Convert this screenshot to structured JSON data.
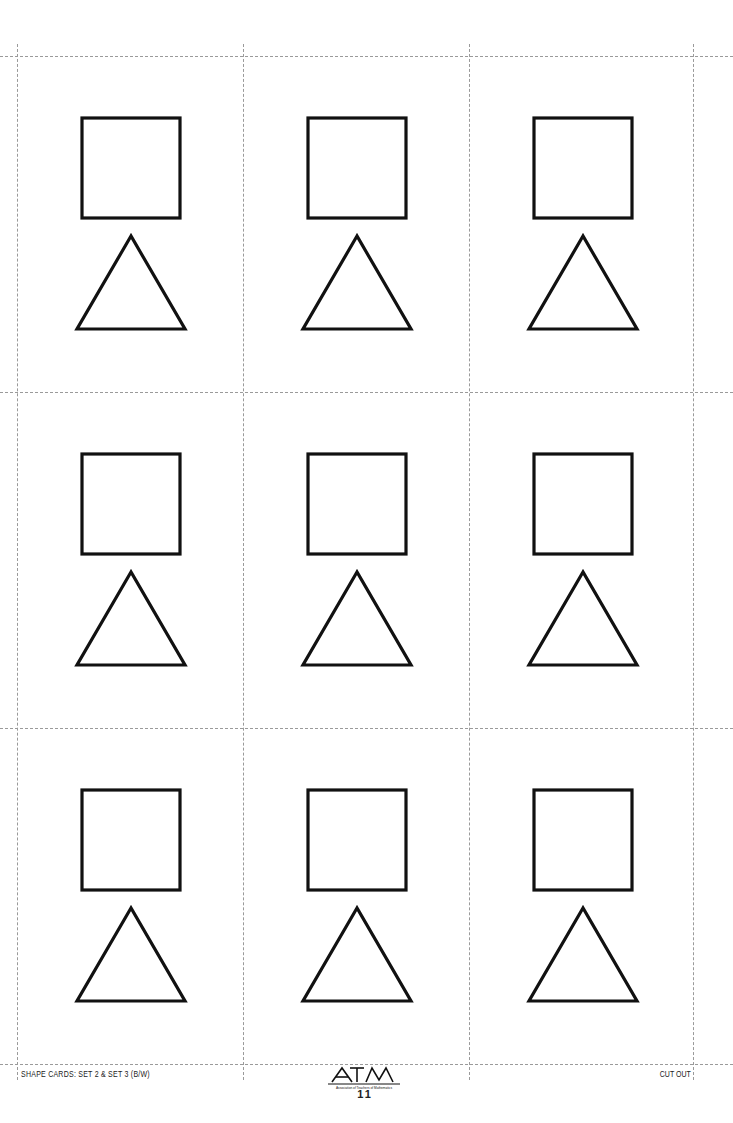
{
  "document": {
    "type": "printable shape cards sheet",
    "grid": {
      "columns": 3,
      "rows": 3
    },
    "cards": [
      {
        "row": 0,
        "col": 0,
        "shapes": [
          "square",
          "triangle"
        ]
      },
      {
        "row": 0,
        "col": 1,
        "shapes": [
          "square",
          "triangle"
        ]
      },
      {
        "row": 0,
        "col": 2,
        "shapes": [
          "square",
          "triangle"
        ]
      },
      {
        "row": 1,
        "col": 0,
        "shapes": [
          "square",
          "triangle"
        ]
      },
      {
        "row": 1,
        "col": 1,
        "shapes": [
          "square",
          "triangle"
        ]
      },
      {
        "row": 1,
        "col": 2,
        "shapes": [
          "square",
          "triangle"
        ]
      },
      {
        "row": 2,
        "col": 0,
        "shapes": [
          "square",
          "triangle"
        ]
      },
      {
        "row": 2,
        "col": 1,
        "shapes": [
          "square",
          "triangle"
        ]
      },
      {
        "row": 2,
        "col": 2,
        "shapes": [
          "square",
          "triangle"
        ]
      }
    ],
    "colors": {
      "stroke": "#111111",
      "cut_line": "#9a9a9a",
      "background": "#ffffff"
    }
  },
  "footer": {
    "left_label": "SHAPE CARDS: SET 2 & SET 3 (B/W)",
    "logo_text": "ATM",
    "logo_subtext": "Association of Teachers of Mathematics",
    "page_number": "11",
    "right_label": "CUT OUT"
  }
}
